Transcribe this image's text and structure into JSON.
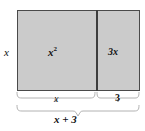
{
  "figure": {
    "kind": "area-model-diagram",
    "title": "",
    "colors": {
      "fill": "#cbcbcb",
      "border": "#4a4a4a",
      "divider": "#3d3d3d",
      "brace": "#b2b2b2",
      "text": "#111111",
      "background": "#ffffff"
    },
    "labels": {
      "height": "x",
      "area_left": "x",
      "area_left_exponent": "2",
      "area_right": "3x",
      "width_left": "x",
      "width_right": "3",
      "total_width": "x + 3"
    },
    "braces": {
      "upper_left_span_label": "x",
      "upper_right_span_label": "3",
      "lower_span_label": "x + 3"
    }
  }
}
